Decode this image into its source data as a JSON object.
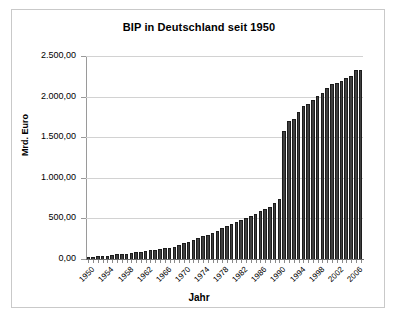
{
  "chart": {
    "title": "BIP in Deutschland seit 1950",
    "xlabel": "Jahr",
    "ylabel": "Mrd. Euro"
  },
  "chart_data": {
    "type": "bar",
    "title": "BIP in Deutschland seit 1950",
    "xlabel": "Jahr",
    "ylabel": "Mrd. Euro",
    "ylim": [
      0,
      2500
    ],
    "ytick_labels": [
      "0,00",
      "500,00",
      "1.000,00",
      "1.500,00",
      "2.000,00",
      "2.500,00"
    ],
    "ytick_values": [
      0,
      500,
      1000,
      1500,
      2000,
      2500
    ],
    "grid": true,
    "legend": null,
    "xtick_labels": [
      "1950",
      "1954",
      "1958",
      "1962",
      "1966",
      "1970",
      "1974",
      "1978",
      "1982",
      "1986",
      "1990",
      "1994",
      "1998",
      "2002",
      "2006"
    ],
    "xtick_step": 4,
    "bar_color": "#404040",
    "categories": [
      1950,
      1951,
      1952,
      1953,
      1954,
      1955,
      1956,
      1957,
      1958,
      1959,
      1960,
      1961,
      1962,
      1963,
      1964,
      1965,
      1966,
      1967,
      1968,
      1969,
      1970,
      1971,
      1972,
      1973,
      1974,
      1975,
      1976,
      1977,
      1978,
      1979,
      1980,
      1981,
      1982,
      1983,
      1984,
      1985,
      1986,
      1987,
      1988,
      1989,
      1990,
      1991,
      1992,
      1993,
      1994,
      1995,
      1996,
      1997,
      1998,
      1999,
      2000,
      2001,
      2002,
      2003,
      2004,
      2005,
      2006,
      2007
    ],
    "values": [
      25,
      30,
      35,
      38,
      42,
      50,
      56,
      61,
      66,
      72,
      83,
      92,
      100,
      106,
      117,
      128,
      137,
      139,
      150,
      168,
      192,
      213,
      235,
      264,
      284,
      298,
      325,
      348,
      376,
      408,
      437,
      458,
      477,
      501,
      527,
      553,
      588,
      610,
      646,
      685,
      745,
      1580,
      1700,
      1720,
      1810,
      1880,
      1910,
      1960,
      2010,
      2050,
      2110,
      2150,
      2170,
      2190,
      2230,
      2250,
      2330,
      2330
    ]
  }
}
